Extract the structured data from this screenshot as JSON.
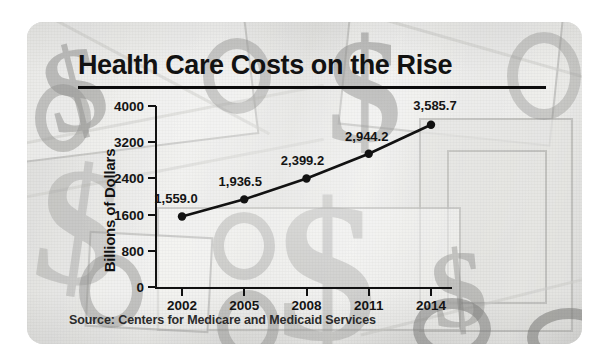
{
  "card": {
    "title": "Health Care Costs on the Rise",
    "source_note": "Source: Centers for Medicare and Medicaid Services"
  },
  "chart_data": {
    "type": "line",
    "title": "Health Care Costs on the Rise",
    "xlabel": "",
    "ylabel": "Billions of Dollars",
    "categories": [
      "2002",
      "2005",
      "2008",
      "2011",
      "2014"
    ],
    "x": [
      2002,
      2005,
      2008,
      2011,
      2014
    ],
    "values": [
      1559.0,
      1936.5,
      2399.2,
      2944.2,
      3585.7
    ],
    "point_labels": [
      "1,559.0",
      "1,936.5",
      "2,399.2",
      "2,944.2",
      "3,585.7"
    ],
    "ylim": [
      0,
      4000
    ],
    "yticks": [
      0,
      800,
      1600,
      2400,
      3200,
      4000
    ],
    "ytick_labels": [
      "0",
      "800",
      "1600",
      "2400",
      "3200",
      "4000"
    ],
    "xtick_labels": [
      "2002",
      "2005",
      "2008",
      "2011",
      "2014"
    ],
    "grid": false,
    "legend": false,
    "series": [
      {
        "name": "National health expenditures",
        "values": [
          1559.0,
          1936.5,
          2399.2,
          2944.2,
          3585.7
        ],
        "color": "#121212",
        "marker": "circle"
      }
    ],
    "source": "Source: Centers for Medicare and Medicaid Services",
    "colors": {
      "line": "#121212",
      "marker": "#121212",
      "axis": "#111111",
      "text": "#141414",
      "card_background": "#e9e9e7"
    },
    "background_watermark": "dollar-sign currency collage"
  }
}
